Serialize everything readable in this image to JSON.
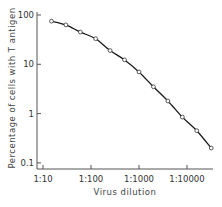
{
  "chart_data": {
    "type": "line",
    "title": "",
    "xlabel": "Virus dilution",
    "ylabel": "Percentage of cells with T antigen",
    "xscale": "log",
    "yscale": "log",
    "x_ticks": [
      {
        "value": 10,
        "label": "1:10"
      },
      {
        "value": 100,
        "label": "1:100"
      },
      {
        "value": 1000,
        "label": "1:1000"
      },
      {
        "value": 10000,
        "label": "1:10000"
      }
    ],
    "y_ticks": [
      {
        "value": 100,
        "label": "100"
      },
      {
        "value": 10,
        "label": "10"
      },
      {
        "value": 1,
        "label": "1"
      },
      {
        "value": 0.1,
        "label": "0.1"
      }
    ],
    "xlim": [
      8,
      45000
    ],
    "ylim": [
      0.08,
      120
    ],
    "grid": false,
    "legend": null,
    "series": [
      {
        "name": "T antigen positive cells",
        "marker": "open-circle",
        "line": "smooth",
        "x_dilution_factor": [
          15,
          30,
          60,
          125,
          250,
          500,
          1000,
          2000,
          4000,
          8000,
          16000,
          32000
        ],
        "x_labels": [
          "1:15",
          "1:30",
          "1:60",
          "1:125",
          "1:250",
          "1:500",
          "1:1000",
          "1:2000",
          "1:4000",
          "1:8000",
          "1:16000",
          "1:32000"
        ],
        "values": [
          75,
          63,
          45,
          33,
          19,
          12.3,
          7,
          3.5,
          1.8,
          0.85,
          0.45,
          0.2
        ]
      }
    ]
  },
  "colors": {
    "line": "#1a1a1a",
    "marker_fill": "#ffffff",
    "axis": "#555555",
    "text": "#333333"
  }
}
